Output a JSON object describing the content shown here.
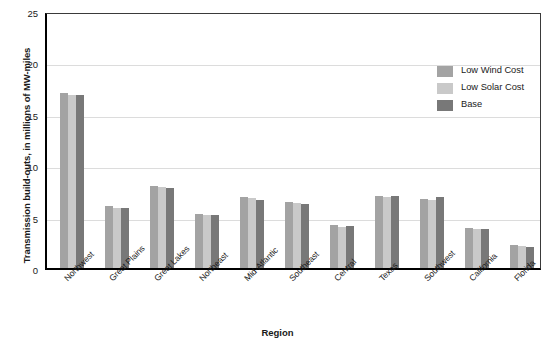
{
  "chart_data": {
    "type": "bar",
    "title": "",
    "xlabel": "Region",
    "ylabel": "Transmission build-outs, in millions of MW-miles",
    "ylim": [
      0,
      25
    ],
    "yticks": [
      0,
      5,
      10,
      15,
      20,
      25
    ],
    "grid": true,
    "legend_position": "top-right",
    "categories": [
      "Northwest",
      "Great Plains",
      "Great Lakes",
      "Northeast",
      "Mid-Atlantic",
      "Southeast",
      "Central",
      "Texas",
      "Southwest",
      "California",
      "Florida"
    ],
    "series": [
      {
        "name": "Low Wind Cost",
        "color": "#a3a3a3",
        "values": [
          17.0,
          6.0,
          8.0,
          5.3,
          6.9,
          6.4,
          4.2,
          7.0,
          6.7,
          3.9,
          2.2
        ]
      },
      {
        "name": "Low Solar Cost",
        "color": "#c9c9c9",
        "values": [
          16.8,
          5.8,
          7.9,
          5.2,
          6.8,
          6.3,
          4.0,
          6.9,
          6.6,
          3.8,
          2.1
        ]
      },
      {
        "name": "Base",
        "color": "#787878",
        "values": [
          16.8,
          5.8,
          7.8,
          5.2,
          6.6,
          6.2,
          4.1,
          7.0,
          6.9,
          3.8,
          2.0
        ]
      }
    ]
  },
  "axes": {
    "y_title": "Transmission build-outs, in millions of MW-miles",
    "x_title": "Region",
    "y_tick_labels": [
      "25",
      "20",
      "15",
      "10",
      "5",
      "0"
    ]
  },
  "legend": {
    "items": [
      {
        "label": "Low Wind Cost",
        "color": "#a3a3a3"
      },
      {
        "label": "Low Solar Cost",
        "color": "#c9c9c9"
      },
      {
        "label": "Base",
        "color": "#787878"
      }
    ]
  },
  "colors": {
    "low_wind_cost": "#a3a3a3",
    "low_solar_cost": "#c9c9c9",
    "base": "#787878",
    "axis": "#000000",
    "gridline": "#dcdcdc",
    "background": "#ffffff"
  }
}
